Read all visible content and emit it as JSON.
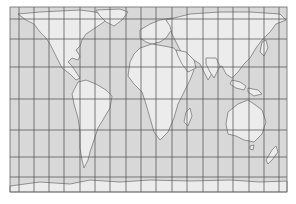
{
  "map": {
    "projection": "equal-area cylindrical world map",
    "frame": {
      "x": 10,
      "y": 7,
      "width": 277,
      "height": 185
    },
    "colors": {
      "background": "#ffffff",
      "ocean": "#d8d8d8",
      "land": "#ececec",
      "coast": "#7a7a7a",
      "grid": "#4a4a4a",
      "frame": "#6a6a6a"
    },
    "grid": {
      "meridians_x": [
        19,
        34,
        49,
        64,
        80,
        95,
        110,
        126,
        141,
        156,
        172,
        187,
        203,
        218,
        233,
        249,
        264,
        279
      ],
      "parallels_y": [
        19,
        39,
        67,
        99,
        130,
        157,
        177
      ]
    },
    "landmasses": [
      {
        "name": "north-america",
        "d": "M18,14 L40,12 L60,11 L80,10 L95,12 L108,16 L104,22 L98,26 L92,30 L86,34 L82,40 L80,46 L76,50 L80,56 L78,60 L72,58 L68,62 L72,66 L76,72 L80,78 L76,80 L70,74 L62,68 L58,60 L54,52 L50,44 L46,38 L40,32 L34,24 L26,20 Z"
      },
      {
        "name": "greenland",
        "d": "M96,10 L120,9 L128,12 L122,20 L114,26 L106,22 L100,16 Z"
      },
      {
        "name": "south-america",
        "d": "M78,82 L86,80 L96,84 L106,90 L112,96 L110,108 L104,118 L98,128 L94,140 L90,152 L88,160 L84,168 L82,160 L80,148 L80,132 L78,118 L74,104 L72,94 Z"
      },
      {
        "name": "europe",
        "d": "M140,30 L150,24 L160,20 L172,18 L176,26 L170,32 L166,38 L160,42 L152,44 L146,42 L140,38 Z"
      },
      {
        "name": "africa",
        "d": "M140,48 L152,44 L164,46 L174,48 L180,56 L186,64 L194,70 L190,80 L184,92 L178,104 L174,118 L168,132 L160,140 L154,132 L150,118 L146,104 L142,92 L134,84 L128,76 L130,62 L134,54 Z"
      },
      {
        "name": "madagascar",
        "d": "M186,112 L190,108 L192,116 L188,126 L184,122 Z"
      },
      {
        "name": "asia",
        "d": "M166,20 L190,14 L220,12 L250,12 L280,14 L286,20 L276,24 L270,32 L262,40 L256,48 L250,58 L244,64 L238,72 L232,78 L226,74 L222,66 L214,70 L208,80 L204,72 L200,64 L194,60 L186,56 L180,50 L176,42 L172,34 L170,26 Z"
      },
      {
        "name": "arabia",
        "d": "M176,50 L186,52 L194,60 L196,68 L188,72 L182,64 L178,56 Z"
      },
      {
        "name": "india",
        "d": "M206,58 L216,58 L220,66 L214,78 L210,72 L206,64 Z"
      },
      {
        "name": "southeast-asia-islands",
        "d": "M232,80 L240,82 L246,86 L244,90 L236,88 L230,84 Z M248,88 L258,90 L262,94 L254,96 L248,92 Z"
      },
      {
        "name": "japan",
        "d": "M262,42 L266,40 L268,48 L264,56 L260,52 Z"
      },
      {
        "name": "australia",
        "d": "M228,112 L238,104 L248,100 L254,104 L262,110 L266,122 L262,134 L254,142 L244,140 L236,136 L228,134 L226,124 Z"
      },
      {
        "name": "tasmania",
        "d": "M250,146 L254,145 L253,150 L250,149 Z"
      },
      {
        "name": "new-zealand",
        "d": "M272,150 L276,146 L278,152 L272,160 L268,164 L266,160 Z"
      },
      {
        "name": "antarctica",
        "d": "M10,186 L40,182 L70,184 L90,180 L120,182 L150,180 L190,181 L230,180 L260,182 L287,181 L287,192 L10,192 Z"
      }
    ]
  }
}
